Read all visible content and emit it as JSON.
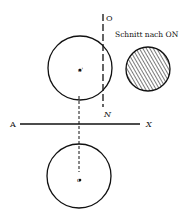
{
  "diagram": {
    "caption": "Schnitt nach ON",
    "labels": {
      "O_top": "O",
      "N": "N",
      "A": "A",
      "X": "X",
      "center_upper": "o'",
      "center_lower": "o"
    },
    "colors": {
      "ink": "#111111",
      "background": "#ffffff"
    }
  }
}
